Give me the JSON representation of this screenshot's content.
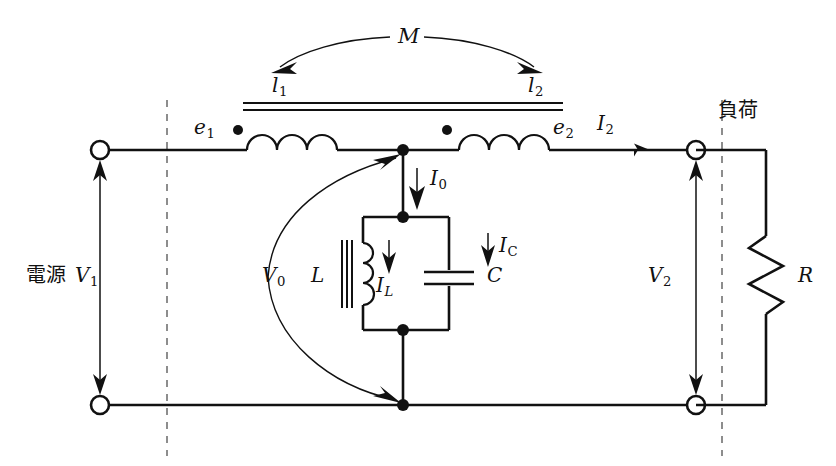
{
  "diagram": {
    "colors": {
      "line": "#111111",
      "dashed": "#7a7a7a",
      "background": "#ffffff"
    }
  },
  "labels": {
    "mutual_inductance": "M",
    "primary_inductance": "l",
    "primary_inductance_sub": "1",
    "secondary_inductance": "l",
    "secondary_inductance_sub": "2",
    "emf_primary": "e",
    "emf_primary_sub": "1",
    "emf_secondary": "e",
    "emf_secondary_sub": "2",
    "current_secondary": "I",
    "current_secondary_sub": "2",
    "current_tank": "I",
    "current_tank_sub": "0",
    "current_inductor": "I",
    "current_inductor_sub": "L",
    "current_capacitor": "I",
    "current_capacitor_sub": "C",
    "voltage_source": "V",
    "voltage_source_sub": "1",
    "voltage_tank": "V",
    "voltage_tank_sub": "0",
    "voltage_load": "V",
    "voltage_load_sub": "2",
    "inductor": "L",
    "capacitor": "C",
    "resistor": "R",
    "source_side": "電源",
    "load_side": "負荷"
  },
  "components": [
    {
      "name": "source-terminal-top",
      "type": "terminal"
    },
    {
      "name": "source-terminal-bottom",
      "type": "terminal"
    },
    {
      "name": "load-terminal-top",
      "type": "terminal"
    },
    {
      "name": "load-terminal-bottom",
      "type": "terminal"
    },
    {
      "name": "primary-coil",
      "type": "inductor"
    },
    {
      "name": "secondary-coil",
      "type": "inductor"
    },
    {
      "name": "tank-inductor",
      "type": "inductor"
    },
    {
      "name": "tank-capacitor",
      "type": "capacitor"
    },
    {
      "name": "load-resistor",
      "type": "resistor"
    }
  ]
}
